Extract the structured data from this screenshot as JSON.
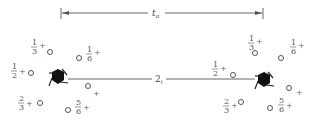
{
  "diagram": {
    "dimension": {
      "label_main": "t",
      "label_sub": "a",
      "x_start": 61,
      "x_end": 263,
      "y": 13
    },
    "link": {
      "label_main": "2",
      "label_sub": "t",
      "x_start": 68,
      "x_end": 255,
      "y": 79
    },
    "left_cluster": {
      "center": [
        58,
        77
      ],
      "sites": [
        {
          "num": "1",
          "den": "3",
          "suffix": "+"
        },
        {
          "num": "1",
          "den": "6",
          "suffix": "+"
        },
        {
          "num": "1",
          "den": "2",
          "suffix": "+"
        },
        {
          "num": "",
          "den": "",
          "suffix": "+"
        },
        {
          "num": "2",
          "den": "3",
          "suffix": "+"
        },
        {
          "num": "5",
          "den": "6",
          "suffix": "+"
        }
      ]
    },
    "right_cluster": {
      "center": [
        264,
        80
      ],
      "sites": [
        {
          "num": "1",
          "den": "3",
          "suffix": "+"
        },
        {
          "num": "1",
          "den": "6",
          "suffix": "+"
        },
        {
          "num": "1",
          "den": "2",
          "suffix": "+"
        },
        {
          "num": "",
          "den": "",
          "suffix": "+"
        },
        {
          "num": "2",
          "den": "3",
          "suffix": "+"
        },
        {
          "num": "5",
          "den": "6",
          "suffix": "+"
        }
      ]
    },
    "colors": {
      "ink": "#444444",
      "hexagon": "#111111",
      "background": "#ffffff"
    }
  }
}
